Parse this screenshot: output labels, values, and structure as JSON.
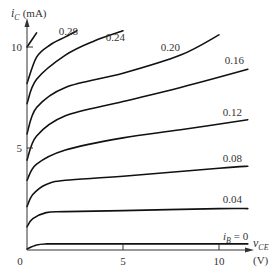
{
  "chart_data": {
    "type": "line",
    "title": "",
    "xlabel": "v_CE (V)",
    "ylabel": "i_C (mA)",
    "xlim": [
      0,
      11.5
    ],
    "ylim": [
      0,
      11
    ],
    "x_ticks": [
      "0",
      "5",
      "10"
    ],
    "y_ticks": [
      "5",
      "10"
    ],
    "grid": false,
    "legend": "inline labels at curve ends",
    "x_axis_label_main": "v",
    "x_axis_label_sub": "CE",
    "x_axis_unit": "(V)",
    "y_axis_label_main": "i",
    "y_axis_label_sub": "C",
    "y_axis_unit": "(mA)",
    "origin_label": "0",
    "series": [
      {
        "name": "i_B = 0",
        "label_main": "i",
        "label_sub": "B",
        "label_rest": " = 0",
        "x": [
          0,
          0.5,
          1,
          2,
          5,
          10,
          11.5
        ],
        "y": [
          0,
          0.2,
          0.25,
          0.25,
          0.25,
          0.25,
          0.25
        ]
      },
      {
        "name": "0.04",
        "label": "0.04",
        "x": [
          0,
          0.3,
          1,
          2,
          5,
          10,
          11.5
        ],
        "y": [
          1.1,
          1.5,
          1.8,
          1.85,
          1.9,
          2.0,
          2.0
        ]
      },
      {
        "name": "0.08",
        "label": "0.08",
        "x": [
          0,
          0.3,
          1,
          2,
          5,
          10,
          11.5
        ],
        "y": [
          2.1,
          2.7,
          3.2,
          3.4,
          3.6,
          4.0,
          4.1
        ]
      },
      {
        "name": "0.12",
        "label": "0.12",
        "x": [
          0,
          0.5,
          2,
          5,
          8,
          11.5
        ],
        "y": [
          3.4,
          4.2,
          4.9,
          5.5,
          5.9,
          6.4
        ]
      },
      {
        "name": "0.16",
        "label": "0.16",
        "x": [
          0,
          0.5,
          2,
          5,
          8,
          11.5
        ],
        "y": [
          4.4,
          5.6,
          6.6,
          7.3,
          8.0,
          8.9
        ]
      },
      {
        "name": "0.20",
        "label": "0.20",
        "x": [
          0,
          0.5,
          2,
          5,
          8,
          10
        ],
        "y": [
          5.7,
          7.0,
          8.0,
          8.7,
          9.6,
          10.6
        ]
      },
      {
        "name": "0.24",
        "label": "0.24",
        "x": [
          0,
          0.5,
          2,
          3.5,
          5
        ],
        "y": [
          7.2,
          8.4,
          9.6,
          10.3,
          10.8
        ]
      },
      {
        "name": "0.28",
        "label": "0.28",
        "x": [
          0,
          0.5,
          1.2,
          2,
          2.6
        ],
        "y": [
          8.2,
          9.5,
          10.1,
          10.5,
          10.8
        ]
      },
      {
        "name": "unlabeled",
        "label": "",
        "x": [
          0,
          0.5
        ],
        "y": [
          10.0,
          10.7
        ]
      }
    ]
  }
}
